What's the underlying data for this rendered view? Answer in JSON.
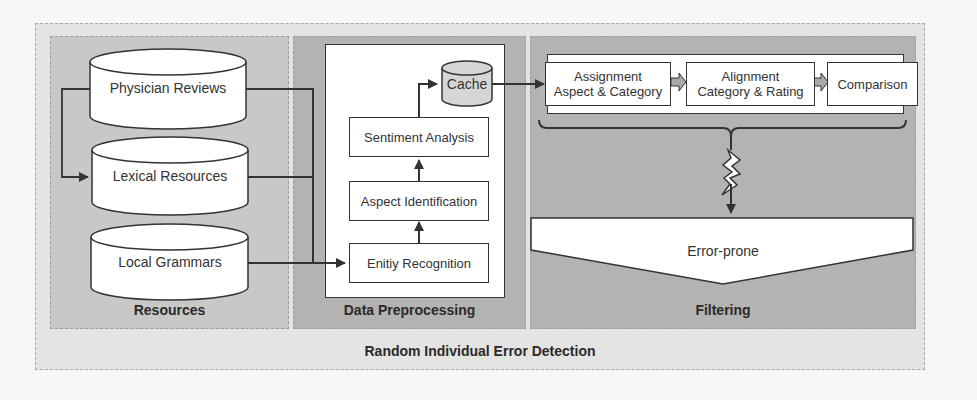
{
  "diagram": {
    "title": "Random Individual Error Detection",
    "panels": {
      "resources": {
        "label": "Resources",
        "databases": [
          {
            "label": "Physician Reviews"
          },
          {
            "label": "Lexical Resources"
          },
          {
            "label": "Local Grammars"
          }
        ]
      },
      "preprocessing": {
        "label": "Data Preprocessing",
        "steps": [
          {
            "label": "Enitiy Recognition"
          },
          {
            "label": "Aspect Identification"
          },
          {
            "label": "Sentiment Analysis"
          }
        ],
        "cache": {
          "label": "Cache"
        }
      },
      "filtering": {
        "label": "Filtering",
        "steps": [
          {
            "line1": "Assignment",
            "line2": "Aspect & Category"
          },
          {
            "line1": "Alignment",
            "line2": "Category & Rating"
          },
          {
            "line1": "Comparison",
            "line2": ""
          }
        ],
        "output": {
          "label": "Error-prone"
        }
      }
    },
    "colors": {
      "outer_bg": "#e4e4e2",
      "resources_bg": "#c8c8c6",
      "panel_bg": "#b3b3b1",
      "stroke": "#333333",
      "small_arrow_fill": "#a9a9a9"
    }
  }
}
